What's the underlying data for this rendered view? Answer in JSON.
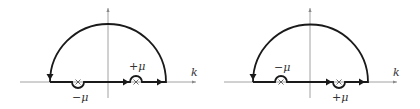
{
  "diagrams": [
    {
      "id": "left",
      "axis_label": "k",
      "pole_minus_label": "−μ",
      "pole_plus_label": "+μ",
      "minus_pole_indent": "below",
      "plus_pole_indent": "above"
    },
    {
      "id": "right",
      "axis_label": "k",
      "pole_minus_label": "−μ",
      "pole_plus_label": "+μ",
      "minus_pole_indent": "above",
      "plus_pole_indent": "below"
    }
  ],
  "colors": {
    "contour": "#1a1a1a",
    "axis": "#8a8a8a",
    "text": "#333333"
  }
}
